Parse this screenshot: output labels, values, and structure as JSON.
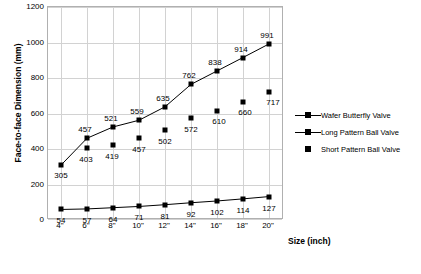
{
  "chart_data": {
    "type": "line",
    "title": "",
    "xlabel": "Size (inch)",
    "ylabel": "Face-to-face Dimension (mm)",
    "categories": [
      "4\"",
      "6\"",
      "8\"",
      "10\"",
      "12\"",
      "14\"",
      "16\"",
      "18\"",
      "20\""
    ],
    "ylim": [
      0,
      1200
    ],
    "yticks": [
      0,
      200,
      400,
      600,
      800,
      1000,
      1200
    ],
    "grid": true,
    "legend_position": "right",
    "series": [
      {
        "name": "Wafer Butterfly Valve",
        "values": [
          54,
          57,
          64,
          71,
          81,
          92,
          102,
          114,
          127
        ]
      },
      {
        "name": "Long Pattern Ball Valve",
        "values": [
          305,
          457,
          521,
          559,
          635,
          762,
          838,
          914,
          991
        ]
      },
      {
        "name": "Short Pattern Ball Valve",
        "values": [
          null,
          403,
          419,
          457,
          502,
          572,
          610,
          660,
          717
        ]
      }
    ]
  }
}
